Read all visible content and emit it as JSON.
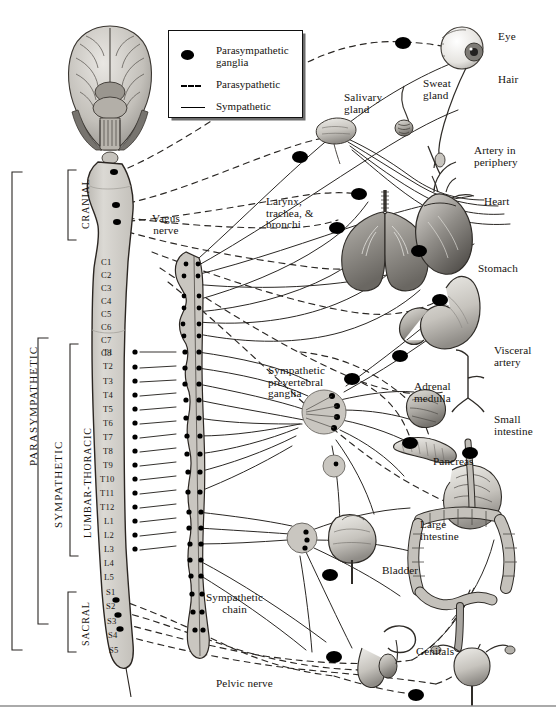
{
  "legend": {
    "items": [
      {
        "key": "filled-ellipse",
        "label": "Parasympathetic\nganglia"
      },
      {
        "key": "dashed-line",
        "label": "Parasypathetic"
      },
      {
        "key": "solid-line",
        "label": "Sympathetic"
      }
    ]
  },
  "division_labels": [
    {
      "name": "parasympathetic-division",
      "text": "PARASYMPATHETIC"
    },
    {
      "name": "sympathetic-division",
      "text": "SYMPATHETIC"
    }
  ],
  "region_labels": [
    {
      "name": "cranial-region",
      "text": "CRANIAL"
    },
    {
      "name": "lumbar-thoracic-region",
      "text": "LUMBAR-THORACIC"
    },
    {
      "name": "sacral-region",
      "text": "SACRAL"
    }
  ],
  "spinal_segments": {
    "cervical": [
      "C1",
      "C2",
      "C3",
      "C4",
      "C5",
      "C6",
      "C7",
      "C8"
    ],
    "thoracic": [
      "T1",
      "T2",
      "T3",
      "T4",
      "T5",
      "T6",
      "T7",
      "T8",
      "T9",
      "T10",
      "T11",
      "T12"
    ],
    "lumbar": [
      "L1",
      "L2",
      "L3",
      "L4",
      "L5"
    ],
    "sacral": [
      "S1",
      "S2",
      "S3",
      "S4",
      "S5"
    ]
  },
  "nerve_labels": [
    {
      "name": "vagus-nerve-label",
      "text": "Vagus\nnerve"
    },
    {
      "name": "sympathetic-chain-label",
      "text": "Sympathetic\nchain"
    },
    {
      "name": "pelvic-nerve-label",
      "text": "Pelvic nerve"
    },
    {
      "name": "sympathetic-prevertebral-ganglia-label",
      "text": "Sympathetic\nprevertebral\nganglia"
    }
  ],
  "organ_labels": [
    {
      "name": "eye-label",
      "text": "Eye"
    },
    {
      "name": "hair-label",
      "text": "Hair"
    },
    {
      "name": "sweat-gland-label",
      "text": "Sweat\ngland"
    },
    {
      "name": "salivary-gland-label",
      "text": "Salivary\ngland"
    },
    {
      "name": "artery-in-periphery-label",
      "text": "Artery in\nperiphery"
    },
    {
      "name": "larynx-trachea-bronchi-label",
      "text": "Larynx,\ntrachea, &\nbronchi"
    },
    {
      "name": "heart-label",
      "text": "Heart"
    },
    {
      "name": "stomach-label",
      "text": "Stomach"
    },
    {
      "name": "visceral-artery-label",
      "text": "Visceral\nartery"
    },
    {
      "name": "adrenal-medulla-label",
      "text": "Adrenal\nmedulla"
    },
    {
      "name": "small-intestine-label",
      "text": "Small\nintestine"
    },
    {
      "name": "pancreas-label",
      "text": "Pancreas"
    },
    {
      "name": "large-intestine-label",
      "text": "Large\nintestine"
    },
    {
      "name": "bladder-label",
      "text": "Bladder"
    },
    {
      "name": "genitals-label",
      "text": "Genitals"
    }
  ],
  "colors": {
    "ink": "#16130f",
    "ganglion_fill": "#000000",
    "cord_fill": "#d2d0ca",
    "cord_stroke": "#2b2622",
    "organ_mid": "#9d9a94",
    "organ_light": "#cfccc6",
    "organ_dark": "#5e5b57",
    "rule": "#8e8e8e",
    "background": "#ffffff"
  }
}
